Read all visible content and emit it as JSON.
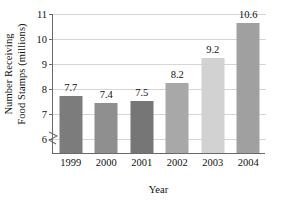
{
  "chart_data": {
    "type": "bar",
    "title": "",
    "xlabel": "Year",
    "ylabel": "Number Receiving Food Stamps (millions)",
    "ylabel_lines": [
      "Number Receiving",
      "Food Stamps (millions)"
    ],
    "categories": [
      "1999",
      "2000",
      "2001",
      "2002",
      "2003",
      "2004"
    ],
    "values": [
      7.7,
      7.4,
      7.5,
      8.2,
      9.2,
      10.6
    ],
    "value_labels": [
      "7.7",
      "7.4",
      "7.5",
      "8.2",
      "9.2",
      "10.6"
    ],
    "bar_colors": [
      "#7c7c7c",
      "#8f8f8f",
      "#767676",
      "#a8a8a8",
      "#d2d2d2",
      "#a0a0a0"
    ],
    "ylim": [
      5.4,
      11
    ],
    "yticks": [
      6,
      7,
      8,
      9,
      10,
      11
    ],
    "ytick_labels": [
      "6",
      "7",
      "8",
      "9",
      "10",
      "11"
    ],
    "grid": true,
    "grid_color": "#d6d6d6",
    "axis_color": "#6a6a6a",
    "axis_break": true,
    "legend": "none",
    "background": "#ffffff"
  }
}
